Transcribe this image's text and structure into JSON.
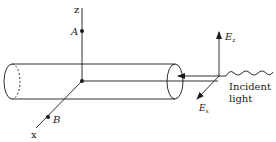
{
  "diagram": {
    "axes": {
      "z_label": "z",
      "x_label": "x"
    },
    "points": {
      "a_label": "A",
      "b_label": "B"
    },
    "field": {
      "ez_label": "E",
      "ez_sub": "z",
      "ex_label": "E",
      "ex_sub": "x"
    },
    "incident": {
      "line1": "Incident",
      "line2": "light"
    },
    "colors": {
      "stroke": "#1a1a1a",
      "background": "#ffffff"
    }
  }
}
